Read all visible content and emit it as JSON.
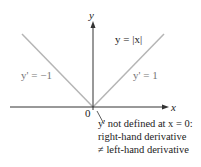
{
  "diagram": {
    "function_label": "y = |x|",
    "left_derivative_label": "y' = −1",
    "right_derivative_label": "y' = 1",
    "x_axis_label": "x",
    "y_axis_label": "y",
    "origin_label": "0",
    "annotation": {
      "line1": "y' not defined at x = 0:",
      "line2": "right-hand derivative",
      "line3": "≠ left-hand derivative"
    },
    "colors": {
      "graph_line": "#b5b5b5",
      "axes": "#333333",
      "text": "#222222",
      "derivative_text": "#777777"
    }
  }
}
